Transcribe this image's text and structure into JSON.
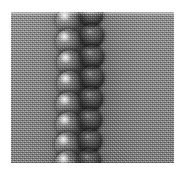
{
  "figure": {
    "kind": "grayscale-micrograph",
    "caption": "",
    "canvas": {
      "width_px": 181,
      "height_px": 173,
      "background_color": "#ffffff"
    },
    "plate": {
      "left_px": 11,
      "top_px": 12,
      "width_px": 163,
      "height_px": 151,
      "base_gray": "#8a8a8a",
      "texture": "halftone-dither-grain",
      "label": "photographic field"
    },
    "colors": {
      "paper_white": "#ffffff",
      "field_gray": "#8a8a8a",
      "highlight_white": "#f5f5f5",
      "shadow_black": "#141414",
      "seam_dark": "#1e1e1e"
    },
    "chain": {
      "orientation": "vertical",
      "center_x_px": 78,
      "bead_count_lit": 8,
      "bead_count_shadow": 7,
      "bead_diameter_px": 24,
      "bead_spacing_px": 20,
      "lit_beads": [
        {
          "cx": 57,
          "cy": 8,
          "d": 25
        },
        {
          "cx": 57,
          "cy": 29,
          "d": 25
        },
        {
          "cx": 58,
          "cy": 50,
          "d": 25
        },
        {
          "cx": 58,
          "cy": 71,
          "d": 25
        },
        {
          "cx": 57,
          "cy": 92,
          "d": 25
        },
        {
          "cx": 57,
          "cy": 112,
          "d": 25
        },
        {
          "cx": 56,
          "cy": 132,
          "d": 25
        },
        {
          "cx": 56,
          "cy": 151,
          "d": 25
        }
      ],
      "shadow_beads": [
        {
          "cx": 80,
          "cy": 3,
          "d": 24
        },
        {
          "cx": 81,
          "cy": 24,
          "d": 24
        },
        {
          "cx": 81,
          "cy": 45,
          "d": 24
        },
        {
          "cx": 81,
          "cy": 66,
          "d": 24
        },
        {
          "cx": 80,
          "cy": 87,
          "d": 24
        },
        {
          "cx": 79,
          "cy": 108,
          "d": 24
        },
        {
          "cx": 79,
          "cy": 129,
          "d": 24
        },
        {
          "cx": 78,
          "cy": 149,
          "d": 24
        }
      ]
    }
  }
}
